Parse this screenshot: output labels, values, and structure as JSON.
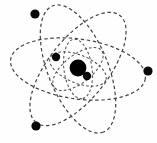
{
  "figure": {
    "background_color": "#fefefe",
    "width": 157,
    "height": 143
  },
  "nucleus": {
    "label": "nucleus",
    "color": "#000000",
    "cx": 78,
    "cy": 68,
    "r": 8.4
  },
  "orbits": {
    "stroke_color": "#3a3a3a",
    "style": "dashed",
    "center_x": 78,
    "center_y": 69,
    "outer": [
      {
        "name": "outer-orbit-1",
        "rx": 68,
        "ry": 30,
        "rotation": 8
      },
      {
        "name": "outer-orbit-2",
        "rx": 68,
        "ry": 30,
        "rotation": 68
      },
      {
        "name": "outer-orbit-3",
        "rx": 68,
        "ry": 30,
        "rotation": 128
      }
    ],
    "inner": [
      {
        "name": "inner-orbit-1",
        "rx": 30,
        "ry": 14,
        "rotation": 22
      },
      {
        "name": "inner-orbit-2",
        "rx": 30,
        "ry": 14,
        "rotation": 82
      },
      {
        "name": "inner-orbit-3",
        "rx": 30,
        "ry": 14,
        "rotation": 142
      }
    ]
  },
  "electrons": [
    {
      "name": "electron-top-left",
      "cx": 35,
      "cy": 14,
      "r": 4.6,
      "color": "#0a0a0a"
    },
    {
      "name": "electron-right",
      "cx": 148,
      "cy": 71,
      "r": 4.6,
      "color": "#0a0a0a"
    },
    {
      "name": "electron-bottom-left",
      "cx": 36,
      "cy": 126,
      "r": 4.6,
      "color": "#0a0a0a"
    },
    {
      "name": "electron-inner-upper-left",
      "cx": 56,
      "cy": 57,
      "r": 4.2,
      "color": "#0a0a0a"
    },
    {
      "name": "electron-inner-lower-right",
      "cx": 87,
      "cy": 76,
      "r": 4.2,
      "color": "#0a0a0a"
    }
  ]
}
